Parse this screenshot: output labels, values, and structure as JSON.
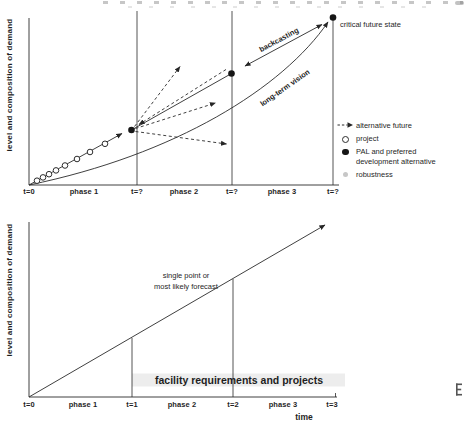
{
  "top_chart": {
    "y_axis_label": "level and composition of demand",
    "timeline": [
      {
        "type": "tick",
        "label": "t=0"
      },
      {
        "type": "phase",
        "label": "phase 1"
      },
      {
        "type": "tick",
        "label": "t=?"
      },
      {
        "type": "phase",
        "label": "phase 2"
      },
      {
        "type": "tick",
        "label": "t=?"
      },
      {
        "type": "phase",
        "label": "phase 3"
      },
      {
        "type": "tick",
        "label": "t=?"
      }
    ],
    "annotations": {
      "backcasting": "backcasting",
      "long_term_vision": "long-term vision",
      "critical_future_state": "critical future state"
    },
    "legend": [
      {
        "symbol": "dashed-arrow-icon",
        "label": "alternative future"
      },
      {
        "symbol": "open-circle-icon",
        "label": "project"
      },
      {
        "symbol": "filled-circle-icon",
        "label": "PAL and preferred development alternative"
      },
      {
        "symbol": "gray-dot-icon",
        "label": "robustness"
      }
    ]
  },
  "bottom_chart": {
    "y_axis_label": "level and composition of demand",
    "x_axis_label": "time",
    "timeline": [
      {
        "type": "tick",
        "label": "t=0"
      },
      {
        "type": "phase",
        "label": "phase 1"
      },
      {
        "type": "tick",
        "label": "t=1"
      },
      {
        "type": "phase",
        "label": "phase 2"
      },
      {
        "type": "tick",
        "label": "t=2"
      },
      {
        "type": "phase",
        "label": "phase 3"
      },
      {
        "type": "tick",
        "label": "t=3"
      }
    ],
    "annotations": {
      "forecast_line1": "single point or",
      "forecast_line2": "most likely forecast",
      "facility": "facility requirements and projects"
    }
  },
  "colors": {
    "ink": "#262626",
    "marker_fill": "#161616",
    "robustness_gray": "#c7c7c7",
    "highlight_band": "#ededed"
  }
}
